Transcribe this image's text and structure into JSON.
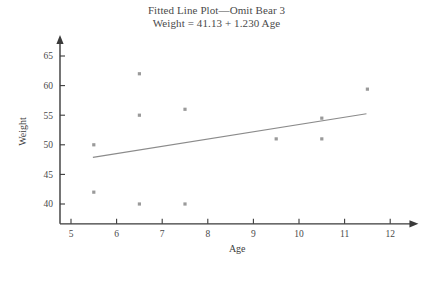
{
  "chart_data": {
    "type": "scatter",
    "title": "Fitted Line Plot—Omit Bear 3",
    "subtitle": "Weight = 41.13 + 1.230 Age",
    "xlabel": "Age",
    "ylabel": "Weight",
    "xlim": [
      4.6,
      12.4
    ],
    "ylim": [
      38.0,
      66.5
    ],
    "xticks": [
      5,
      6,
      7,
      8,
      9,
      10,
      11,
      12
    ],
    "yticks": [
      40,
      45,
      50,
      55,
      60,
      65
    ],
    "grid": false,
    "legend": false,
    "marker_color": "#9a9a9a",
    "line_color": "#8b8b8b",
    "axis_color": "#3a3a3a",
    "points": [
      {
        "x": 5.5,
        "y": 50.0
      },
      {
        "x": 5.5,
        "y": 42.0
      },
      {
        "x": 6.5,
        "y": 62.0
      },
      {
        "x": 6.5,
        "y": 55.0
      },
      {
        "x": 6.5,
        "y": 40.0
      },
      {
        "x": 7.5,
        "y": 56.0
      },
      {
        "x": 7.5,
        "y": 40.0
      },
      {
        "x": 9.5,
        "y": 51.0
      },
      {
        "x": 10.5,
        "y": 54.5
      },
      {
        "x": 10.5,
        "y": 51.0
      },
      {
        "x": 11.5,
        "y": 59.4
      }
    ],
    "fit_line": {
      "intercept": 41.13,
      "slope": 1.23,
      "x_start": 5.48,
      "x_end": 11.48,
      "equation": "Weight = 41.13 + 1.230 Age"
    }
  }
}
